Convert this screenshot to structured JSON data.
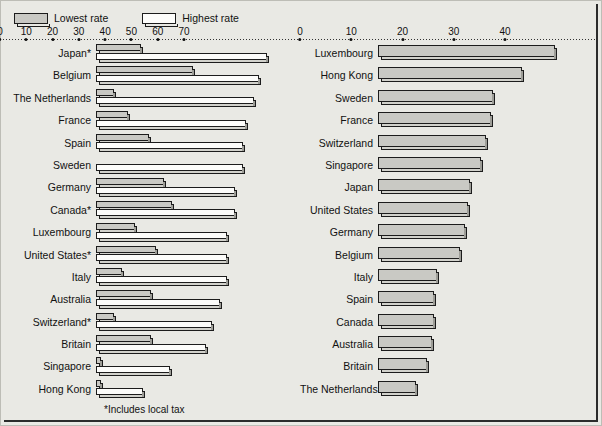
{
  "legend": {
    "items": [
      {
        "key": "low",
        "label": "Lowest rate",
        "swatch": "low-rate-swatch"
      },
      {
        "key": "high",
        "label": "Highest rate",
        "swatch": "high-rate-swatch"
      }
    ]
  },
  "footnote": "*Includes local tax",
  "chart_data": [
    {
      "id": "income-tax-rates",
      "type": "bar",
      "orientation": "horizontal",
      "title": "",
      "xlabel": "",
      "ylabel": "",
      "xlim": [
        0,
        70
      ],
      "xticks": [
        0,
        10,
        20,
        30,
        40,
        50,
        60,
        70
      ],
      "xticklabels": [
        "0",
        "10",
        "20",
        "30",
        "40",
        "50",
        "60",
        "70"
      ],
      "grid": false,
      "legend_position": "top-left",
      "categories": [
        "Japan*",
        "Belgium",
        "The Netherlands",
        "France",
        "Spain",
        "Sweden",
        "Germany",
        "Canada*",
        "Luxembourg",
        "United States*",
        "Italy",
        "Australia",
        "Switzerland*",
        "Britain",
        "Singapore",
        "Hong Kong"
      ],
      "series": [
        {
          "name": "Lowest rate",
          "values": [
            17,
            37,
            7,
            12,
            20,
            0,
            26,
            29,
            15,
            23,
            10,
            21,
            7,
            21,
            2,
            2
          ]
        },
        {
          "name": "Highest rate",
          "values": [
            65,
            62,
            60,
            57,
            56,
            56,
            53,
            53,
            50,
            50,
            50,
            47,
            44,
            42,
            28,
            18
          ]
        }
      ]
    },
    {
      "id": "tax-revenue-share",
      "type": "bar",
      "orientation": "horizontal",
      "title": "",
      "xlabel": "",
      "ylabel": "",
      "xlim": [
        0,
        40
      ],
      "xticks": [
        0,
        10,
        20,
        30,
        40
      ],
      "xticklabels": [
        "0",
        "10",
        "20",
        "30",
        "40"
      ],
      "grid": false,
      "legend_position": "none",
      "categories": [
        "Luxembourg",
        "Hong Kong",
        "Sweden",
        "France",
        "Switzerland",
        "Singapore",
        "Japan",
        "United States",
        "Germany",
        "Belgium",
        "Italy",
        "Spain",
        "Canada",
        "Australia",
        "Britain",
        "The Netherlands"
      ],
      "series": [
        {
          "name": "Rate",
          "values": [
            34.5,
            28,
            22.5,
            22,
            21,
            20,
            18,
            17.5,
            17,
            16,
            11.5,
            11,
            11,
            10.5,
            9.5,
            7.5
          ]
        }
      ]
    }
  ]
}
